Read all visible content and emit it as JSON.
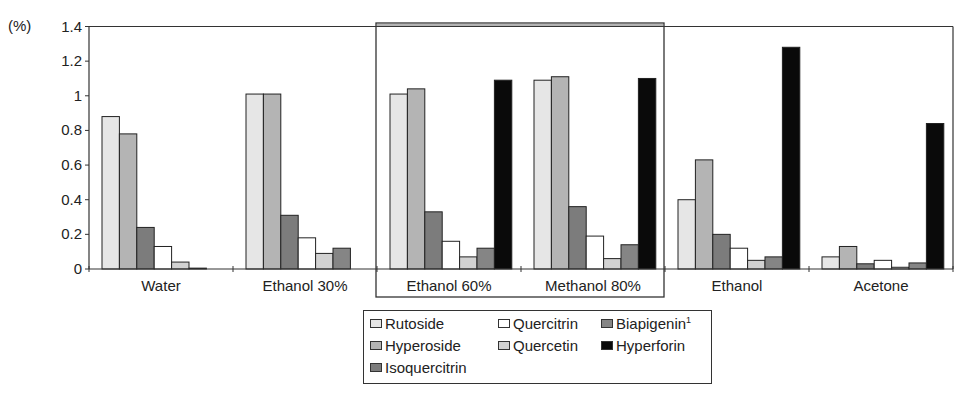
{
  "chart_data": {
    "type": "bar",
    "title": "",
    "xlabel": "",
    "ylabel": "(%)",
    "ylim": [
      0,
      1.4
    ],
    "yticks": [
      0,
      0.2,
      0.4,
      0.6,
      0.8,
      1,
      1.2,
      1.4
    ],
    "ytick_labels": [
      "0",
      "0.2",
      "0.4",
      "0.6",
      "0.8",
      "1",
      "1.2",
      "1.4"
    ],
    "grid": false,
    "legend_position": "bottom-center",
    "categories": [
      "Water",
      "Ethanol 30%",
      "Ethanol 60%",
      "Methanol 80%",
      "Ethanol",
      "Acetone"
    ],
    "highlighted_categories": [
      "Ethanol 60%",
      "Methanol 80%"
    ],
    "series": [
      {
        "name": "Rutoside",
        "color": "#e6e6e6",
        "values": [
          0.88,
          1.01,
          1.01,
          1.09,
          0.4,
          0.07
        ]
      },
      {
        "name": "Hyperoside",
        "color": "#b4b4b4",
        "values": [
          0.78,
          1.01,
          1.04,
          1.11,
          0.63,
          0.13
        ]
      },
      {
        "name": "Isoquercitrin",
        "color": "#7c7c7c",
        "values": [
          0.24,
          0.31,
          0.33,
          0.36,
          0.2,
          0.03
        ]
      },
      {
        "name": "Quercitrin",
        "color": "#ffffff",
        "values": [
          0.13,
          0.18,
          0.16,
          0.19,
          0.12,
          0.05
        ]
      },
      {
        "name": "Quercetin",
        "color": "#d2d2d2",
        "values": [
          0.04,
          0.09,
          0.07,
          0.06,
          0.05,
          0.01
        ]
      },
      {
        "name": "Biapigenin",
        "color": "#858585",
        "values": [
          0.005,
          0.12,
          0.12,
          0.14,
          0.07,
          0.035
        ]
      },
      {
        "name": "Hyperforin",
        "color": "#0a0a0a",
        "values": [
          0,
          0,
          1.09,
          1.1,
          1.28,
          0.84
        ]
      }
    ]
  },
  "legend": {
    "items": [
      {
        "label": "Rutoside",
        "sup": ""
      },
      {
        "label": "Hyperoside",
        "sup": ""
      },
      {
        "label": "Isoquercitrin",
        "sup": ""
      },
      {
        "label": "Quercitrin",
        "sup": ""
      },
      {
        "label": "Quercetin",
        "sup": ""
      },
      {
        "label": "Biapigenin",
        "sup": "1"
      },
      {
        "label": "Hyperforin",
        "sup": ""
      }
    ]
  }
}
